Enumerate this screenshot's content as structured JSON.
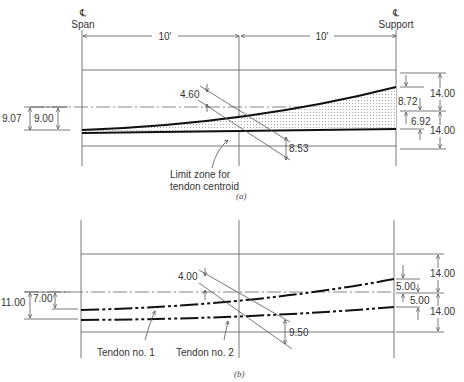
{
  "panel_a": {
    "caption": "(a)",
    "span_symbol": "℄",
    "span_label": "Span",
    "support_symbol": "℄",
    "support_label": "Support",
    "dim_left": "10'",
    "dim_right": "10'",
    "dim_top_depth": "14.00",
    "dim_bottom_depth": "14.00",
    "dim_upper_limit_support": "8.72",
    "dim_lower_limit_support": "6.92",
    "dim_midspan_upper": "4.60",
    "dim_midspan_lower": "8.53",
    "dim_span_outer": "9.07",
    "dim_span_inner": "9.00",
    "zone_label_line1": "Limit zone for",
    "zone_label_line2": "tendon centroid"
  },
  "panel_b": {
    "caption": "(b)",
    "dim_top_depth": "14.00",
    "dim_bottom_depth": "14.00",
    "dim_tendon1_support": "5.00",
    "dim_tendon2_support": "5.00",
    "dim_midspan_upper": "4.00",
    "dim_midspan_lower": "9.50",
    "dim_span_outer": "11.00",
    "dim_span_inner": "7.00",
    "tendon1_label": "Tendon no. 1",
    "tendon2_label": "Tendon no. 2"
  }
}
